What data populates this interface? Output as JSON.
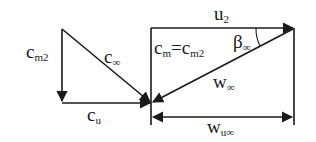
{
  "diagram": {
    "type": "velocity-triangle",
    "labels": {
      "cm2": {
        "main": "c",
        "sub": "m2"
      },
      "c_inf": {
        "main": "c",
        "sub": "∞"
      },
      "cu": {
        "main": "c",
        "sub": "u"
      },
      "u2": {
        "main": "u",
        "sub": "2"
      },
      "cm_eq": {
        "main1": "c",
        "sub1": "m",
        "eq": "=",
        "main2": "c",
        "sub2": "m2"
      },
      "beta_inf": {
        "main": "β",
        "sub": "∞"
      },
      "w_inf": {
        "main": "w",
        "sub": "∞"
      },
      "wu_inf": {
        "main": "w",
        "sub": "u∞"
      }
    },
    "line_color": "#1a1a1a"
  }
}
